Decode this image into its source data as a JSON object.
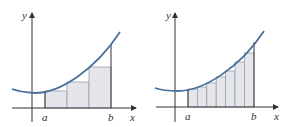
{
  "figures": [
    {
      "name": "left-riemann-sum-n3",
      "axis_labels": {
        "x": "x",
        "y": "y"
      },
      "interval_labels": {
        "a": "a",
        "b": "b"
      },
      "rectangle_count": 3
    },
    {
      "name": "left-riemann-sum-n7",
      "axis_labels": {
        "x": "x",
        "y": "y"
      },
      "interval_labels": {
        "a": "a",
        "b": "b"
      },
      "rectangle_count": 7
    }
  ],
  "colors": {
    "curve": "#4a6f9a",
    "rect_fill": "#e4e6ec",
    "rect_stroke": "#9a9da6",
    "axis": "#333333"
  }
}
